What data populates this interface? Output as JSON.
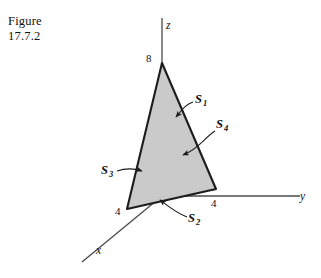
{
  "caption": {
    "line1": "Figure",
    "line2": "17.7.2"
  },
  "diagram": {
    "type": "3d-solid-sketch",
    "solid": "tetrahedron",
    "axes": [
      {
        "name": "z-axis",
        "label": "z",
        "direction": "up"
      },
      {
        "name": "y-axis",
        "label": "y",
        "direction": "right"
      },
      {
        "name": "x-axis",
        "label": "x",
        "direction": "down-left"
      }
    ],
    "intercepts": [
      {
        "axis": "z",
        "value": "8"
      },
      {
        "axis": "y",
        "value": "4"
      },
      {
        "axis": "x",
        "value": "4"
      }
    ],
    "surface_labels": [
      {
        "name": "S1",
        "text": "S",
        "subscript": "1"
      },
      {
        "name": "S2",
        "text": "S",
        "subscript": "2"
      },
      {
        "name": "S3",
        "text": "S",
        "subscript": "3"
      },
      {
        "name": "S4",
        "text": "S",
        "subscript": "4"
      }
    ],
    "colors": {
      "background": "#ffffff",
      "face_fill": "#c9c9c9",
      "face_fill_light": "#d4d4d4",
      "outline": "#1c1c1c",
      "axis": "#3a3a3a",
      "hidden_edge": "#7d7d7d",
      "text": "#111111"
    }
  }
}
